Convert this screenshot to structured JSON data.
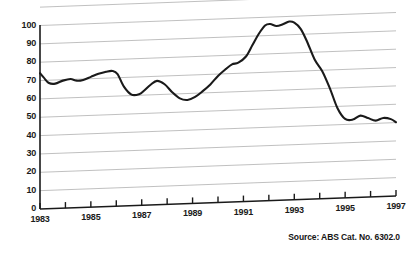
{
  "figure": {
    "source_note": "Source: ABS Cat. No. 6302.0"
  },
  "chart_data": {
    "type": "line",
    "title": "",
    "subtitle": "",
    "xlabel": "",
    "ylabel": "",
    "xlim": [
      1983,
      1997
    ],
    "ylim": [
      0,
      100
    ],
    "grid": true,
    "grid_axis": "y",
    "legend": false,
    "legend_position": "none",
    "line_color": "#1a1a1a",
    "grid_color": "#b9b9b9",
    "axis_color": "#1a1a1a",
    "series_name": "Index",
    "yticks": [
      0,
      10,
      20,
      30,
      40,
      50,
      60,
      70,
      80,
      90,
      100
    ],
    "ytick_labels": [
      "0",
      "10",
      "20",
      "30",
      "40",
      "50",
      "60",
      "70",
      "80",
      "90",
      "100"
    ],
    "xticks": [
      1983,
      1984,
      1985,
      1986,
      1987,
      1988,
      1989,
      1990,
      1991,
      1992,
      1993,
      1994,
      1995,
      1996,
      1997
    ],
    "xtick_labels": [
      "1983",
      "",
      "1985",
      "",
      "1987",
      "",
      "1989",
      "",
      "1991",
      "",
      "1993",
      "",
      "1995",
      "",
      "1997"
    ],
    "xtick_labels_shown": [
      "1983",
      "1985",
      "1987",
      "1989",
      "1991",
      "1993",
      "1995",
      "1997"
    ],
    "x": [
      1983.0,
      1983.15,
      1983.35,
      1983.6,
      1983.9,
      1984.2,
      1984.45,
      1984.7,
      1985.0,
      1985.3,
      1985.6,
      1985.85,
      1986.05,
      1986.3,
      1986.6,
      1986.9,
      1987.1,
      1987.35,
      1987.6,
      1987.9,
      1988.2,
      1988.5,
      1988.8,
      1989.1,
      1989.4,
      1989.7,
      1990.0,
      1990.3,
      1990.55,
      1990.8,
      1991.1,
      1991.35,
      1991.6,
      1991.85,
      1992.05,
      1992.3,
      1992.55,
      1992.8,
      1993.0,
      1993.25,
      1993.5,
      1993.8,
      1994.1,
      1994.4,
      1994.7,
      1995.0,
      1995.3,
      1995.6,
      1995.9,
      1996.2,
      1996.5,
      1996.8,
      1997.0
    ],
    "y": [
      74.0,
      71.5,
      68.5,
      68.0,
      69.5,
      70.2,
      69.2,
      69.5,
      71.0,
      72.5,
      73.5,
      73.8,
      72.0,
      65.0,
      60.5,
      60.6,
      62.5,
      65.5,
      67.5,
      65.5,
      61.0,
      57.5,
      56.5,
      58.0,
      61.0,
      64.5,
      69.0,
      72.5,
      75.0,
      75.8,
      79.0,
      85.0,
      91.0,
      95.5,
      96.2,
      95.0,
      95.8,
      97.2,
      96.5,
      93.0,
      86.0,
      76.0,
      69.5,
      60.0,
      49.0,
      43.0,
      42.5,
      44.5,
      43.0,
      41.5,
      42.8,
      42.0,
      40.2
    ],
    "annotations": []
  }
}
